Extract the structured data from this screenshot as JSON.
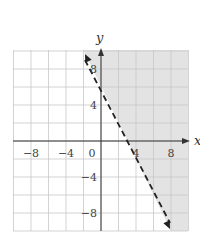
{
  "chart_data": {
    "type": "line",
    "title": "",
    "xlabel": "x",
    "ylabel": "y",
    "xlim": [
      -10,
      10
    ],
    "ylim": [
      -10,
      10
    ],
    "grid": true,
    "grid_step": 2,
    "x_ticks": [
      -8,
      -4,
      0,
      4,
      8
    ],
    "y_ticks": [
      8,
      4,
      -4,
      -8
    ],
    "x_tick_labels": [
      "−8",
      "−4",
      "0",
      "4",
      "8"
    ],
    "y_tick_labels": [
      "8",
      "4",
      "−4",
      "−8"
    ],
    "series": [
      {
        "name": "boundary line",
        "style": "dashed",
        "equation": "y = -2x + 6",
        "points": [
          [
            -2,
            10
          ],
          [
            0,
            6
          ],
          [
            3,
            0
          ],
          [
            8,
            -10
          ]
        ]
      }
    ],
    "shaded_region": {
      "description": "half-plane to the right of the dashed line",
      "inequality": "y > -2x + 6",
      "color": "#e3e3e3"
    },
    "colors": {
      "grid": "#c8c8c8",
      "axis": "#333333",
      "line": "#222222",
      "shade": "#e3e3e3"
    }
  }
}
